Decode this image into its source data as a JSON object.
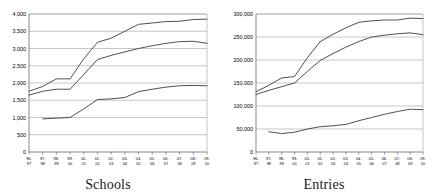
{
  "figure": {
    "panels": [
      {
        "name": "schools",
        "title": "Schools",
        "chart_data": {
          "type": "line",
          "title": "Schools",
          "xlabel": "",
          "ylabel": "",
          "ylim": [
            0,
            4000
          ],
          "ytick_labels": [
            "0",
            "500",
            "1,000",
            "1,500",
            "2,000",
            "2,500",
            "3,000",
            "3,500",
            "4,000"
          ],
          "ytick_values": [
            0,
            500,
            1000,
            1500,
            2000,
            2500,
            3000,
            3500,
            4000
          ],
          "grid": true,
          "legend": "none",
          "categories": [
            "96-97",
            "97-98",
            "98-99",
            "99-00",
            "00-01",
            "01-02",
            "02-03",
            "03-04",
            "04-05",
            "05-06",
            "06-07",
            "07-08",
            "08-09",
            "09-10"
          ],
          "xtick_labels_top": [
            "96-",
            "97-",
            "98-",
            "99-",
            "00-",
            "01-",
            "02-",
            "03-",
            "04-",
            "05-",
            "06-",
            "07-",
            "08-",
            "09-"
          ],
          "xtick_labels_bottom": [
            "97",
            "98",
            "99",
            "00",
            "01",
            "02",
            "03",
            "04",
            "05",
            "06",
            "07",
            "08",
            "09",
            "10"
          ],
          "series": [
            {
              "name": "series-1",
              "values": [
                1760,
                1900,
                2120,
                2120,
                2700,
                3180,
                3300,
                3500,
                3700,
                3740,
                3780,
                3790,
                3840,
                3850
              ]
            },
            {
              "name": "series-2",
              "values": [
                1650,
                1760,
                1820,
                1820,
                2250,
                2680,
                2800,
                2900,
                3000,
                3080,
                3150,
                3200,
                3210,
                3150
              ]
            },
            {
              "name": "series-3",
              "values": [
                null,
                960,
                980,
                1000,
                1250,
                1520,
                1540,
                1580,
                1750,
                1820,
                1880,
                1920,
                1930,
                1920
              ]
            }
          ]
        }
      },
      {
        "name": "entries",
        "title": "Entries",
        "chart_data": {
          "type": "line",
          "title": "Entries",
          "xlabel": "",
          "ylabel": "",
          "ylim": [
            0,
            300000
          ],
          "ytick_labels": [
            "0",
            "50,000",
            "100,000",
            "150,000",
            "200,000",
            "250,000",
            "300,000"
          ],
          "ytick_values": [
            0,
            50000,
            100000,
            150000,
            200000,
            250000,
            300000
          ],
          "grid": true,
          "legend": "none",
          "categories": [
            "96-97",
            "97-98",
            "98-99",
            "99-00",
            "00-01",
            "01-02",
            "02-03",
            "03-04",
            "04-05",
            "05-06",
            "06-07",
            "07-08",
            "08-09",
            "09-10"
          ],
          "xtick_labels_top": [
            "96-",
            "97-",
            "98-",
            "99-",
            "00-",
            "01-",
            "02-",
            "03-",
            "04-",
            "05-",
            "06-",
            "07-",
            "08-",
            "09-"
          ],
          "xtick_labels_bottom": [
            "97",
            "98",
            "99",
            "00",
            "01",
            "02",
            "03",
            "04",
            "05",
            "06",
            "07",
            "08",
            "09",
            "10"
          ],
          "series": [
            {
              "name": "series-1",
              "values": [
                131000,
                145000,
                161000,
                164000,
                205000,
                240000,
                256000,
                270000,
                282000,
                285000,
                287000,
                287000,
                291000,
                290000
              ]
            },
            {
              "name": "series-2",
              "values": [
                125000,
                134000,
                142000,
                150000,
                175000,
                199000,
                214000,
                228000,
                240000,
                250000,
                254000,
                257000,
                259000,
                255000
              ]
            },
            {
              "name": "series-3",
              "values": [
                null,
                44000,
                40000,
                43000,
                50000,
                55000,
                57000,
                60000,
                68000,
                75000,
                82000,
                88000,
                93000,
                92000
              ]
            }
          ]
        }
      }
    ]
  }
}
